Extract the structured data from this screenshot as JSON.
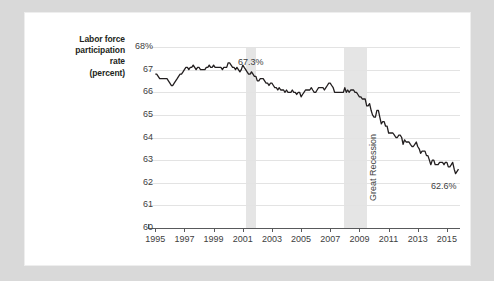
{
  "axis_title_lines": [
    "Labor force",
    "participation",
    "rate",
    "(percent)"
  ],
  "annotations": [
    {
      "name": "peak-value-label",
      "text": "67.3%",
      "x": 213,
      "y": 44
    },
    {
      "name": "latest-value-label",
      "text": "62.6%",
      "x": 406,
      "y": 168
    },
    {
      "name": "great-recession-label",
      "text": "Great Recession",
      "x": 343,
      "y": 188
    }
  ],
  "chart_data": {
    "type": "line",
    "title": "",
    "xlabel": "",
    "ylabel": "Labor force participation rate (percent)",
    "xlim": [
      1994.5,
      2015.9
    ],
    "ylim": [
      60,
      68
    ],
    "grid": true,
    "legend": "none",
    "ytick_labels": [
      "68%",
      "67",
      "66",
      "65",
      "64",
      "63",
      "62",
      "61",
      "60"
    ],
    "ytick_values": [
      68,
      67,
      66,
      65,
      64,
      63,
      62,
      61,
      60
    ],
    "xtick_labels": [
      "1995",
      "1997",
      "1999",
      "2001",
      "2003",
      "2005",
      "2007",
      "2009",
      "2011",
      "2013",
      "2015"
    ],
    "xtick_values": [
      1995,
      1997,
      1999,
      2001,
      2003,
      2005,
      2007,
      2009,
      2011,
      2013,
      2015
    ],
    "shaded_bands": [
      {
        "label": "",
        "start": 2001.2,
        "end": 2001.9,
        "color": "#e0e0e0"
      },
      {
        "label": "Great Recession",
        "start": 2007.95,
        "end": 2009.5,
        "color": "#e0e0e0"
      }
    ],
    "peak": {
      "year": 2000.1,
      "value": 67.3,
      "label": "67.3%"
    },
    "latest": {
      "year": 2015.8,
      "value": 62.6,
      "label": "62.6%"
    },
    "series": [
      {
        "name": "Labor force participation rate",
        "color": "#231f20",
        "x": [
          1995.0,
          1995.1,
          1995.2,
          1995.3,
          1995.4,
          1995.5,
          1995.6,
          1995.7,
          1995.8,
          1995.9,
          1996.0,
          1996.1,
          1996.2,
          1996.3,
          1996.4,
          1996.5,
          1996.6,
          1996.7,
          1996.8,
          1996.9,
          1997.0,
          1997.1,
          1997.2,
          1997.3,
          1997.4,
          1997.5,
          1997.6,
          1997.7,
          1997.8,
          1997.9,
          1998.0,
          1998.1,
          1998.2,
          1998.3,
          1998.4,
          1998.5,
          1998.6,
          1998.7,
          1998.8,
          1998.9,
          1999.0,
          1999.1,
          1999.2,
          1999.3,
          1999.4,
          1999.5,
          1999.6,
          1999.7,
          1999.8,
          1999.9,
          2000.0,
          2000.1,
          2000.2,
          2000.3,
          2000.4,
          2000.5,
          2000.6,
          2000.7,
          2000.8,
          2000.9,
          2001.0,
          2001.1,
          2001.2,
          2001.3,
          2001.4,
          2001.5,
          2001.6,
          2001.7,
          2001.8,
          2001.9,
          2002.0,
          2002.1,
          2002.2,
          2002.3,
          2002.4,
          2002.5,
          2002.6,
          2002.7,
          2002.8,
          2002.9,
          2003.0,
          2003.1,
          2003.2,
          2003.3,
          2003.4,
          2003.5,
          2003.6,
          2003.7,
          2003.8,
          2003.9,
          2004.0,
          2004.1,
          2004.2,
          2004.3,
          2004.4,
          2004.5,
          2004.6,
          2004.7,
          2004.8,
          2004.9,
          2005.0,
          2005.1,
          2005.2,
          2005.3,
          2005.4,
          2005.5,
          2005.6,
          2005.7,
          2005.8,
          2005.9,
          2006.0,
          2006.1,
          2006.2,
          2006.3,
          2006.4,
          2006.5,
          2006.6,
          2006.7,
          2006.8,
          2006.9,
          2007.0,
          2007.1,
          2007.2,
          2007.3,
          2007.4,
          2007.5,
          2007.6,
          2007.7,
          2007.8,
          2007.9,
          2008.0,
          2008.1,
          2008.2,
          2008.3,
          2008.4,
          2008.5,
          2008.6,
          2008.7,
          2008.8,
          2008.9,
          2009.0,
          2009.1,
          2009.2,
          2009.3,
          2009.4,
          2009.5,
          2009.6,
          2009.7,
          2009.8,
          2009.9,
          2010.0,
          2010.1,
          2010.2,
          2010.3,
          2010.4,
          2010.5,
          2010.6,
          2010.7,
          2010.8,
          2010.9,
          2011.0,
          2011.1,
          2011.2,
          2011.3,
          2011.4,
          2011.5,
          2011.6,
          2011.7,
          2011.8,
          2011.9,
          2012.0,
          2012.1,
          2012.2,
          2012.3,
          2012.4,
          2012.5,
          2012.6,
          2012.7,
          2012.8,
          2012.9,
          2013.0,
          2013.1,
          2013.2,
          2013.3,
          2013.4,
          2013.5,
          2013.6,
          2013.7,
          2013.8,
          2013.9,
          2014.0,
          2014.1,
          2014.2,
          2014.3,
          2014.4,
          2014.5,
          2014.6,
          2014.7,
          2014.8,
          2014.9,
          2015.0,
          2015.1,
          2015.2,
          2015.3,
          2015.4,
          2015.5,
          2015.6,
          2015.8
        ],
        "values": [
          66.8,
          66.8,
          66.7,
          66.6,
          66.6,
          66.6,
          66.6,
          66.6,
          66.6,
          66.5,
          66.4,
          66.3,
          66.3,
          66.4,
          66.5,
          66.6,
          66.7,
          66.8,
          66.8,
          66.9,
          67.0,
          67.1,
          67.1,
          67.0,
          67.1,
          67.1,
          67.2,
          67.1,
          67.0,
          67.1,
          67.1,
          67.0,
          67.0,
          67.0,
          67.0,
          67.1,
          67.1,
          67.2,
          67.1,
          67.1,
          67.2,
          67.1,
          67.1,
          67.1,
          67.1,
          67.1,
          67.0,
          67.1,
          67.1,
          67.1,
          67.3,
          67.3,
          67.2,
          67.1,
          67.1,
          67.0,
          67.1,
          67.0,
          66.9,
          67.0,
          67.2,
          67.1,
          67.0,
          66.9,
          66.8,
          66.8,
          66.9,
          66.8,
          66.7,
          66.7,
          66.5,
          66.5,
          66.6,
          66.6,
          66.6,
          66.5,
          66.4,
          66.4,
          66.3,
          66.4,
          66.4,
          66.3,
          66.2,
          66.2,
          66.1,
          66.2,
          66.1,
          66.1,
          66.1,
          66.0,
          66.1,
          66.0,
          66.0,
          66.0,
          66.1,
          66.0,
          66.0,
          65.9,
          66.0,
          66.0,
          65.8,
          65.9,
          66.0,
          66.1,
          66.1,
          66.1,
          66.1,
          66.2,
          66.1,
          66.0,
          66.0,
          66.1,
          66.2,
          66.2,
          66.2,
          66.2,
          66.1,
          66.2,
          66.3,
          66.4,
          66.4,
          66.3,
          66.2,
          66.0,
          66.0,
          66.0,
          66.0,
          66.0,
          66.0,
          66.0,
          66.2,
          66.0,
          66.1,
          66.0,
          66.1,
          66.1,
          66.1,
          66.0,
          66.0,
          65.9,
          65.8,
          65.8,
          65.7,
          65.7,
          65.7,
          65.4,
          65.4,
          65.5,
          65.2,
          65.0,
          64.9,
          64.9,
          65.2,
          65.2,
          64.9,
          64.6,
          64.7,
          64.7,
          64.5,
          64.5,
          64.2,
          64.2,
          64.2,
          64.2,
          64.1,
          64.0,
          64.0,
          64.1,
          64.1,
          64.0,
          63.7,
          63.9,
          63.8,
          63.8,
          63.8,
          63.7,
          63.6,
          63.6,
          63.7,
          63.8,
          63.6,
          63.5,
          63.3,
          63.4,
          63.4,
          63.4,
          63.2,
          63.2,
          63.0,
          62.8,
          63.0,
          63.0,
          62.8,
          62.8,
          62.8,
          62.9,
          62.9,
          62.9,
          62.8,
          62.9,
          62.9,
          62.7,
          62.7,
          62.8,
          62.9,
          62.6,
          62.4,
          62.6
        ]
      }
    ]
  }
}
